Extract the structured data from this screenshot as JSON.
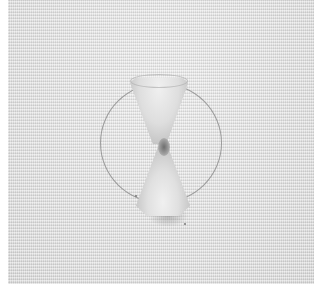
{
  "image": {
    "description": "Photograph of white linen fabric with a pencil-drawn circle and a gathered ribbon bow-like stitch in the center",
    "alt": "Ribbon embroidery on linen fabric with a traced circle",
    "colors": {
      "border": "#ffffff",
      "fabric": "#e4e4e4",
      "pencil_line": "#8a8a8a",
      "ribbon_highlight": "#f0f0f0",
      "ribbon_shadow": "#a0a0a0",
      "knot": "#6e6e6e"
    }
  }
}
